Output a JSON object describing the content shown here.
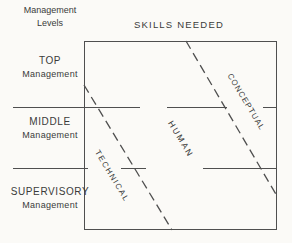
{
  "figure": {
    "title": "SKILLS NEEDED",
    "axis_left_header": {
      "line1": "Management",
      "line2": "Levels"
    },
    "levels": [
      {
        "name": "TOP",
        "sub": "Management"
      },
      {
        "name": "MIDDLE",
        "sub": "Management"
      },
      {
        "name": "SUPERVISORY",
        "sub": "Management"
      }
    ],
    "skills": [
      {
        "label": "TECHNICAL"
      },
      {
        "label": "HUMAN"
      },
      {
        "label": "CONCEPTUAL"
      }
    ],
    "colors": {
      "line": "#4f4f4f",
      "text": "#3a3a3a",
      "background": "#fbfaf7"
    }
  }
}
